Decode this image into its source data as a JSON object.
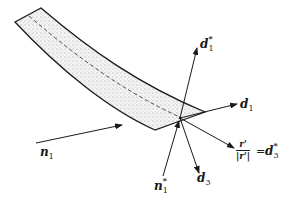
{
  "figure": {
    "type": "rod-cross-section-director-diagram",
    "colors": {
      "stroke": "#1a1a1a",
      "fill_stipple": "#f2f2f2",
      "background": "#ffffff"
    }
  },
  "labels": {
    "d1_star": {
      "base": "d",
      "sub": "1",
      "sup": "*"
    },
    "d1": {
      "base": "d",
      "sub": "1"
    },
    "n1": {
      "base": "n",
      "sub": "1"
    },
    "n1_star": {
      "base": "n",
      "sub": "1",
      "sup": "*"
    },
    "d3": {
      "base": "d",
      "sub": "3"
    },
    "r_ratio": {
      "numerator": "r'",
      "denominator": "|r'|",
      "equals": "=",
      "rhs_base": "d",
      "rhs_sub": "3",
      "rhs_sup": "*"
    }
  }
}
